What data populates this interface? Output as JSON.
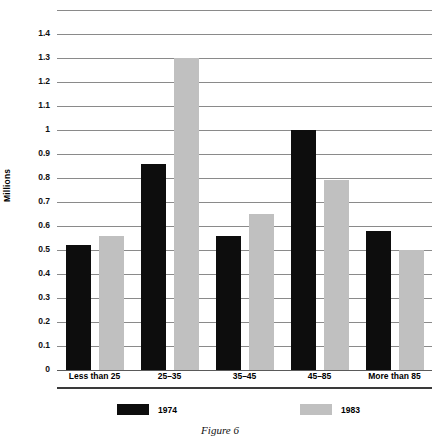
{
  "caption": "Figure 6",
  "chart_data": {
    "type": "bar",
    "title": "",
    "xlabel": "",
    "ylabel": "Millions",
    "ylim": [
      0,
      1.5
    ],
    "ytick_step": 0.1,
    "grid": true,
    "legend_position": "bottom",
    "orientation": "vertical",
    "grouped": true,
    "categories": [
      "Less than 25",
      "25–35",
      "35–45",
      "45–85",
      "More than 85"
    ],
    "yticks": [
      "0",
      "0.1",
      "0.2",
      "0.3",
      "0.4",
      "0.5",
      "0.6",
      "0.7",
      "0.8",
      "0.9",
      "1",
      "1.1",
      "1.2",
      "1.3",
      "1.4"
    ],
    "ytick_values": [
      0,
      0.1,
      0.2,
      0.3,
      0.4,
      0.5,
      0.6,
      0.7,
      0.8,
      0.9,
      1.0,
      1.1,
      1.2,
      1.3,
      1.4
    ],
    "series": [
      {
        "name": "1974",
        "color": "#0d0d0d",
        "values": [
          0.52,
          0.86,
          0.56,
          1.0,
          0.58
        ]
      },
      {
        "name": "1983",
        "color": "#c0c0c0",
        "values": [
          0.56,
          1.3,
          0.65,
          0.79,
          0.5
        ]
      }
    ]
  }
}
